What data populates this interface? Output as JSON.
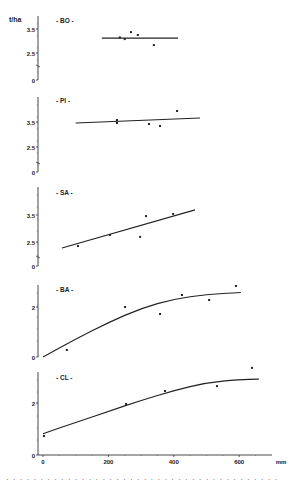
{
  "chart_data": [
    {
      "type": "scatter",
      "panel": "BO",
      "title": "- BO -",
      "xlabel": "mm",
      "ylabel": "t/ha",
      "yticks": [
        "0",
        "2.5",
        "3.5"
      ],
      "axis_break": true,
      "points": [
        [
          235,
          3.15
        ],
        [
          250,
          3.08
        ],
        [
          269,
          3.37
        ],
        [
          290,
          3.25
        ],
        [
          339,
          2.83
        ]
      ],
      "fit": {
        "kind": "linear",
        "x": [
          180,
          413
        ],
        "y": [
          3.12,
          3.12
        ]
      }
    },
    {
      "type": "scatter",
      "panel": "PI",
      "title": "- PI -",
      "xlabel": "mm",
      "ylabel": "t/ha",
      "yticks": [
        "0",
        "2.5",
        "3.5"
      ],
      "axis_break": true,
      "points": [
        [
          226,
          3.58
        ],
        [
          226,
          3.46
        ],
        [
          324,
          3.42
        ],
        [
          358,
          3.34
        ],
        [
          410,
          3.94
        ]
      ],
      "fit": {
        "kind": "linear",
        "x": [
          100,
          480
        ],
        "y": [
          3.46,
          3.66
        ]
      }
    },
    {
      "type": "scatter",
      "panel": "SA",
      "title": "- SA -",
      "xlabel": "mm",
      "ylabel": "t/ha",
      "yticks": [
        "0",
        "2.5",
        "3.5"
      ],
      "axis_break": true,
      "points": [
        [
          107,
          2.35
        ],
        [
          205,
          2.76
        ],
        [
          297,
          2.69
        ],
        [
          315,
          3.46
        ],
        [
          398,
          3.54
        ]
      ],
      "fit": {
        "kind": "linear",
        "x": [
          58,
          465
        ],
        "y": [
          2.28,
          3.69
        ]
      }
    },
    {
      "type": "scatter",
      "panel": "BA",
      "title": "- BA -",
      "xlabel": "mm",
      "ylabel": "t/ha",
      "yticks": [
        "0",
        "2"
      ],
      "axis_break": false,
      "points": [
        [
          73,
          0.28
        ],
        [
          251,
          2.0
        ],
        [
          358,
          1.72
        ],
        [
          425,
          2.48
        ],
        [
          508,
          2.28
        ],
        [
          590,
          2.84
        ]
      ],
      "fit": {
        "kind": "curve",
        "x": [
          0,
          100,
          200,
          300,
          400,
          500,
          600,
          605
        ],
        "y": [
          0.0,
          0.72,
          1.38,
          1.95,
          2.32,
          2.5,
          2.58,
          2.58
        ]
      }
    },
    {
      "type": "scatter",
      "panel": "CL",
      "title": "- CL -",
      "xlabel": "mm",
      "ylabel": "t/ha",
      "yticks": [
        "0",
        "2"
      ],
      "axis_break": false,
      "xticks": [
        "0",
        "200",
        "400",
        "600"
      ],
      "points": [
        [
          3,
          0.73
        ],
        [
          254,
          1.96
        ],
        [
          373,
          2.46
        ],
        [
          532,
          2.65
        ],
        [
          639,
          3.35
        ]
      ],
      "fit": {
        "kind": "curve",
        "x": [
          0,
          100,
          200,
          300,
          400,
          500,
          600,
          660
        ],
        "y": [
          0.82,
          1.25,
          1.68,
          2.1,
          2.48,
          2.78,
          2.9,
          2.92
        ]
      }
    }
  ],
  "figure": {
    "y_unit_label": "t/ha",
    "x_unit_label": "mm",
    "x_ticks": [
      "0",
      "200",
      "400",
      "600"
    ],
    "caption_fragment": "· · ·   · · · · ·   · · · · · ·   · ·   · · · · · · ·   · · · · ·   · · · · · · ·   · · · · ·"
  }
}
